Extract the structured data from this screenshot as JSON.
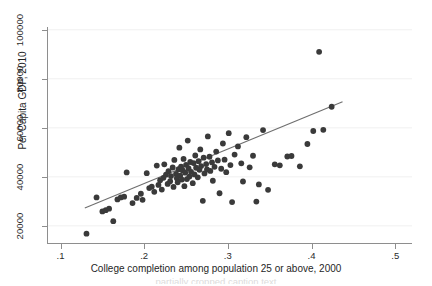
{
  "figure": {
    "background_color": "#ffffff",
    "marker_color": "#3a3a3a",
    "line_color": "#6e6e6e",
    "grid_color": "#f0f0f0",
    "axis_color": "#8e8e8e",
    "bottom_caption": "partially cropped caption text"
  },
  "chart_data": {
    "type": "scatter",
    "title": "",
    "xlabel": "College completion among population 25 or above, 2000",
    "ylabel": "Per Capita GDP, 2010",
    "xlim": [
      0.085,
      0.52
    ],
    "ylim": [
      13000,
      104000
    ],
    "xticks": [
      0.1,
      0.2,
      0.3,
      0.4,
      0.5
    ],
    "xticklabels": [
      ".1",
      ".2",
      ".3",
      ".4",
      ".5"
    ],
    "yticks": [
      20000,
      40000,
      60000,
      80000,
      100000
    ],
    "yticklabels": [
      "20000",
      "40000",
      "60000",
      "80000",
      "100000"
    ],
    "grid": "horizontal",
    "legend": null,
    "fit_line": {
      "label": "linear fit",
      "x": [
        0.129,
        0.437
      ],
      "y": [
        27300,
        70600
      ]
    },
    "points": [
      [
        0.131,
        16800
      ],
      [
        0.143,
        31600
      ],
      [
        0.15,
        25900
      ],
      [
        0.154,
        26400
      ],
      [
        0.158,
        27000
      ],
      [
        0.163,
        21900
      ],
      [
        0.168,
        30800
      ],
      [
        0.172,
        31600
      ],
      [
        0.176,
        31900
      ],
      [
        0.179,
        41800
      ],
      [
        0.186,
        29300
      ],
      [
        0.191,
        31400
      ],
      [
        0.196,
        33100
      ],
      [
        0.198,
        30600
      ],
      [
        0.203,
        41500
      ],
      [
        0.206,
        35400
      ],
      [
        0.209,
        36000
      ],
      [
        0.212,
        33900
      ],
      [
        0.215,
        44600
      ],
      [
        0.217,
        36700
      ],
      [
        0.219,
        38600
      ],
      [
        0.221,
        34800
      ],
      [
        0.223,
        39600
      ],
      [
        0.224,
        45100
      ],
      [
        0.226,
        40900
      ],
      [
        0.228,
        37100
      ],
      [
        0.229,
        42300
      ],
      [
        0.231,
        38200
      ],
      [
        0.232,
        40300
      ],
      [
        0.234,
        43800
      ],
      [
        0.235,
        35900
      ],
      [
        0.236,
        46900
      ],
      [
        0.238,
        41200
      ],
      [
        0.239,
        39400
      ],
      [
        0.24,
        37800
      ],
      [
        0.241,
        43100
      ],
      [
        0.242,
        51900
      ],
      [
        0.243,
        40500
      ],
      [
        0.244,
        44200
      ],
      [
        0.245,
        38900
      ],
      [
        0.246,
        42600
      ],
      [
        0.247,
        47300
      ],
      [
        0.248,
        36200
      ],
      [
        0.249,
        41700
      ],
      [
        0.25,
        44900
      ],
      [
        0.251,
        39100
      ],
      [
        0.252,
        54800
      ],
      [
        0.253,
        43400
      ],
      [
        0.254,
        40100
      ],
      [
        0.255,
        46100
      ],
      [
        0.256,
        42000
      ],
      [
        0.258,
        37400
      ],
      [
        0.259,
        45600
      ],
      [
        0.26,
        41000
      ],
      [
        0.261,
        48700
      ],
      [
        0.262,
        43700
      ],
      [
        0.264,
        39800
      ],
      [
        0.265,
        46400
      ],
      [
        0.266,
        42900
      ],
      [
        0.267,
        51200
      ],
      [
        0.268,
        44400
      ],
      [
        0.27,
        30200
      ],
      [
        0.271,
        47800
      ],
      [
        0.272,
        41400
      ],
      [
        0.274,
        45200
      ],
      [
        0.275,
        43000
      ],
      [
        0.276,
        56500
      ],
      [
        0.278,
        48200
      ],
      [
        0.279,
        42400
      ],
      [
        0.281,
        45900
      ],
      [
        0.282,
        38400
      ],
      [
        0.284,
        44100
      ],
      [
        0.286,
        50300
      ],
      [
        0.288,
        46700
      ],
      [
        0.29,
        33300
      ],
      [
        0.292,
        43300
      ],
      [
        0.294,
        53600
      ],
      [
        0.296,
        47000
      ],
      [
        0.298,
        41900
      ],
      [
        0.301,
        57800
      ],
      [
        0.303,
        44800
      ],
      [
        0.305,
        29700
      ],
      [
        0.308,
        49100
      ],
      [
        0.312,
        52400
      ],
      [
        0.316,
        45500
      ],
      [
        0.318,
        38100
      ],
      [
        0.322,
        56200
      ],
      [
        0.326,
        43900
      ],
      [
        0.33,
        48600
      ],
      [
        0.334,
        29900
      ],
      [
        0.337,
        36900
      ],
      [
        0.342,
        59100
      ],
      [
        0.348,
        34700
      ],
      [
        0.356,
        45100
      ],
      [
        0.362,
        44700
      ],
      [
        0.371,
        48300
      ],
      [
        0.376,
        48500
      ],
      [
        0.386,
        44300
      ],
      [
        0.395,
        53400
      ],
      [
        0.402,
        58700
      ],
      [
        0.409,
        91000
      ],
      [
        0.414,
        59200
      ],
      [
        0.424,
        68600
      ]
    ]
  }
}
